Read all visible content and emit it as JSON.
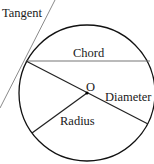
{
  "diagram": {
    "labels": {
      "tangent": "Tangent",
      "chord": "Chord",
      "center": "O",
      "diameter": "Diameter",
      "radius": "Radius"
    },
    "colors": {
      "stroke": "#111111",
      "tangent": "#8a8a8a",
      "chord": "#777777",
      "text": "#1a1a1a"
    }
  }
}
